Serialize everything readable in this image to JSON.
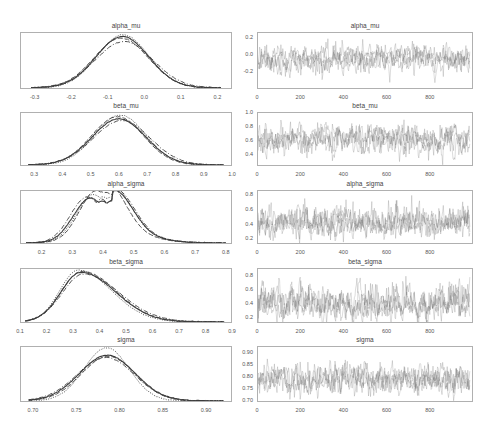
{
  "figure": {
    "colors": {
      "frame": "#b0b0b0",
      "kde_line": "#3c3c3c",
      "trace_line": "#6e6e6e",
      "tick_text": "#555555",
      "title_text": "#444444"
    }
  },
  "chart_data": [
    {
      "type": "line",
      "panel": "kde",
      "title": "alpha_mu",
      "xlim": [
        -0.34,
        0.24
      ],
      "xticks": [
        -0.3,
        -0.2,
        -0.1,
        0.0,
        0.1,
        0.2
      ],
      "xtick_labels": [
        "-0.3",
        "-0.2",
        "-0.1",
        "0.0",
        "0.1",
        "0.2"
      ],
      "ylim": [
        0,
        1.0
      ],
      "grid": false,
      "legend": "none",
      "x_range": [
        -0.31,
        0.21
      ],
      "series": [
        {
          "name": "chain 0",
          "mean": -0.06,
          "sd": 0.072,
          "peak": 0.93,
          "dash": ""
        },
        {
          "name": "chain 1",
          "mean": -0.058,
          "sd": 0.07,
          "peak": 0.96,
          "dash": "1,1.5"
        },
        {
          "name": "chain 2",
          "mean": -0.063,
          "sd": 0.074,
          "peak": 0.9,
          "dash": "5,2"
        },
        {
          "name": "chain 3",
          "mean": -0.055,
          "sd": 0.078,
          "peak": 0.84,
          "dash": "5,2,1,2"
        }
      ]
    },
    {
      "type": "line",
      "panel": "trace",
      "title": "alpha_mu",
      "xlim": [
        0,
        1000
      ],
      "xticks": [
        0,
        200,
        400,
        600,
        800
      ],
      "xtick_labels": [
        "0",
        "200",
        "400",
        "600",
        "800"
      ],
      "ylim": [
        -0.42,
        0.26
      ],
      "yticks": [
        0.2,
        0.0,
        -0.2
      ],
      "ytick_labels": [
        "0.2",
        "0.0",
        "-0.2"
      ],
      "mean": -0.06,
      "sd": 0.075,
      "n_draws": 1000,
      "n_chains": 4,
      "grid": false
    },
    {
      "type": "line",
      "panel": "kde",
      "title": "beta_mu",
      "xlim": [
        0.25,
        1.0
      ],
      "xticks": [
        0.3,
        0.4,
        0.5,
        0.6,
        0.7,
        0.8,
        0.9,
        1.0
      ],
      "xtick_labels": [
        "0.3",
        "0.4",
        "0.5",
        "0.6",
        "0.7",
        "0.8",
        "0.9",
        "1.0"
      ],
      "ylim": [
        0,
        1.0
      ],
      "grid": false,
      "legend": "none",
      "x_range": [
        0.28,
        0.97
      ],
      "series": [
        {
          "name": "chain 0",
          "mean": 0.6,
          "sd": 0.095,
          "peak": 0.88,
          "dash": ""
        },
        {
          "name": "chain 1",
          "mean": 0.605,
          "sd": 0.09,
          "peak": 0.95,
          "dash": "1,1.5"
        },
        {
          "name": "chain 2",
          "mean": 0.595,
          "sd": 0.092,
          "peak": 0.92,
          "dash": "5,2"
        },
        {
          "name": "chain 3",
          "mean": 0.61,
          "sd": 0.1,
          "peak": 0.85,
          "dash": "5,2,1,2"
        }
      ]
    },
    {
      "type": "line",
      "panel": "trace",
      "title": "beta_mu",
      "xlim": [
        0,
        1000
      ],
      "xticks": [
        0,
        200,
        400,
        600,
        800
      ],
      "xtick_labels": [
        "0",
        "200",
        "400",
        "600",
        "800"
      ],
      "ylim": [
        0.22,
        1.0
      ],
      "yticks": [
        1.0,
        0.8,
        0.6,
        0.4
      ],
      "ytick_labels": [
        "1.0",
        "0.8",
        "0.6",
        "0.4"
      ],
      "mean": 0.6,
      "sd": 0.095,
      "n_draws": 1000,
      "n_chains": 4,
      "grid": false
    },
    {
      "type": "line",
      "panel": "kde",
      "title": "alpha_sigma",
      "xlim": [
        0.13,
        0.82
      ],
      "xticks": [
        0.2,
        0.3,
        0.4,
        0.5,
        0.6,
        0.7,
        0.8
      ],
      "xtick_labels": [
        "0.2",
        "0.3",
        "0.4",
        "0.5",
        "0.6",
        "0.7",
        "0.8"
      ],
      "ylim": [
        0,
        1.0
      ],
      "grid": false,
      "legend": "none",
      "x_range": [
        0.15,
        0.8
      ],
      "series": [
        {
          "name": "chain 0",
          "mode1": 0.36,
          "mode2": 0.435,
          "dip": 0.8,
          "peak": 0.83,
          "dash": ""
        },
        {
          "name": "chain 1",
          "mode1": 0.37,
          "mode2": 0.43,
          "dip": 0.88,
          "peak": 0.9,
          "dash": "1,1.5"
        },
        {
          "name": "chain 2",
          "mode1": 0.38,
          "mode2": 0.41,
          "dip": 0.98,
          "peak": 0.98,
          "dash": "5,2"
        },
        {
          "name": "chain 3",
          "mode1": 0.35,
          "mode2": 0.44,
          "dip": 0.84,
          "peak": 0.85,
          "dash": "5,2,1,2"
        }
      ]
    },
    {
      "type": "line",
      "panel": "trace",
      "title": "alpha_sigma",
      "xlim": [
        0,
        1000
      ],
      "xticks": [
        0,
        200,
        400,
        600,
        800
      ],
      "xtick_labels": [
        "0",
        "200",
        "400",
        "600",
        "800"
      ],
      "ylim": [
        0.12,
        0.86
      ],
      "yticks": [
        0.8,
        0.6,
        0.4,
        0.2
      ],
      "ytick_labels": [
        "0.8",
        "0.6",
        "0.4",
        "0.2"
      ],
      "mean": 0.4,
      "sd": 0.085,
      "skew": true,
      "n_draws": 1000,
      "n_chains": 4,
      "grid": false
    },
    {
      "type": "line",
      "panel": "kde",
      "title": "beta_sigma",
      "xlim": [
        0.1,
        0.9
      ],
      "xticks": [
        0.1,
        0.2,
        0.3,
        0.4,
        0.5,
        0.6,
        0.7,
        0.8,
        0.9
      ],
      "xtick_labels": [
        "0.1",
        "0.2",
        "0.3",
        "0.4",
        "0.5",
        "0.6",
        "0.7",
        "0.8",
        "0.9"
      ],
      "ylim": [
        0,
        1.0
      ],
      "grid": false,
      "legend": "none",
      "x_range": [
        0.12,
        0.87
      ],
      "series": [
        {
          "name": "chain 0",
          "mode": 0.33,
          "sd_left": 0.075,
          "sd_right": 0.13,
          "peak": 0.93,
          "dash": ""
        },
        {
          "name": "chain 1",
          "mode": 0.32,
          "sd_left": 0.07,
          "sd_right": 0.125,
          "peak": 0.97,
          "dash": "1,1.5"
        },
        {
          "name": "chain 2",
          "mode": 0.335,
          "sd_left": 0.078,
          "sd_right": 0.128,
          "peak": 0.95,
          "dash": "5,2"
        },
        {
          "name": "chain 3",
          "mode": 0.34,
          "sd_left": 0.08,
          "sd_right": 0.135,
          "peak": 0.9,
          "dash": "5,2,1,2"
        }
      ]
    },
    {
      "type": "line",
      "panel": "trace",
      "title": "beta_sigma",
      "xlim": [
        0,
        1000
      ],
      "xticks": [
        0,
        200,
        400,
        600,
        800
      ],
      "xtick_labels": [
        "0",
        "200",
        "400",
        "600",
        "800"
      ],
      "ylim": [
        0.12,
        0.9
      ],
      "yticks": [
        0.8,
        0.6,
        0.4,
        0.2
      ],
      "ytick_labels": [
        "0.8",
        "0.6",
        "0.4",
        "0.2"
      ],
      "mean": 0.38,
      "sd": 0.1,
      "skew": true,
      "n_draws": 1000,
      "n_chains": 4,
      "grid": false
    },
    {
      "type": "line",
      "panel": "kde",
      "title": "sigma",
      "xlim": [
        0.685,
        0.93
      ],
      "xticks": [
        0.7,
        0.75,
        0.8,
        0.85,
        0.9
      ],
      "xtick_labels": [
        "0.70",
        "0.75",
        "0.80",
        "0.85",
        "0.90"
      ],
      "ylim": [
        0,
        1.0
      ],
      "grid": false,
      "legend": "none",
      "x_range": [
        0.695,
        0.92
      ],
      "series": [
        {
          "name": "chain 0",
          "mean": 0.786,
          "sd": 0.032,
          "peak": 0.84,
          "dash": ""
        },
        {
          "name": "chain 1",
          "mean": 0.785,
          "sd": 0.026,
          "peak": 0.98,
          "dash": "1,1.5"
        },
        {
          "name": "chain 2",
          "mean": 0.787,
          "sd": 0.031,
          "peak": 0.82,
          "dash": "5,2"
        },
        {
          "name": "chain 3",
          "mean": 0.784,
          "sd": 0.033,
          "peak": 0.8,
          "dash": "5,2,1,2"
        }
      ]
    },
    {
      "type": "line",
      "panel": "trace",
      "title": "sigma",
      "xlim": [
        0,
        1000
      ],
      "xticks": [
        0,
        200,
        400,
        600,
        800
      ],
      "xtick_labels": [
        "0",
        "200",
        "400",
        "600",
        "800"
      ],
      "ylim": [
        0.69,
        0.925
      ],
      "yticks": [
        0.9,
        0.85,
        0.8,
        0.75,
        0.7
      ],
      "ytick_labels": [
        "0.90",
        "0.85",
        "0.80",
        "0.75",
        "0.70"
      ],
      "mean": 0.786,
      "sd": 0.03,
      "n_draws": 1000,
      "n_chains": 4,
      "grid": false
    }
  ]
}
